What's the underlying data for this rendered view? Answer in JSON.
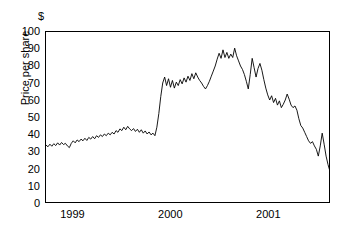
{
  "chart_data": {
    "type": "line",
    "title": "",
    "subtitle": "",
    "xlabel": "",
    "ylabel": "Price per share",
    "currency_symbol": "$",
    "grid": false,
    "legend": false,
    "legend_position": "none",
    "xlim": [
      1998.72,
      2001.63
    ],
    "ylim": [
      0,
      100
    ],
    "yticks": [
      100,
      90,
      80,
      70,
      60,
      50,
      40,
      30,
      20,
      10,
      0
    ],
    "ytick_labels": [
      "100",
      "90",
      "80",
      "70",
      "60",
      "50",
      "40",
      "30",
      "20",
      "10",
      "0"
    ],
    "xticks": [
      1999,
      2000,
      2001
    ],
    "xtick_labels": [
      "1999",
      "2000",
      "2001"
    ],
    "line_color": "#000000",
    "line_width": 1,
    "series": [
      {
        "name": "Price per share",
        "x": [
          1998.72,
          1998.75,
          1998.78,
          1998.8,
          1998.83,
          1998.86,
          1998.89,
          1998.91,
          1998.94,
          1998.97,
          1999.0,
          1999.03,
          1999.05,
          1999.08,
          1999.11,
          1999.14,
          1999.16,
          1999.19,
          1999.22,
          1999.25,
          1999.28,
          1999.3,
          1999.33,
          1999.36,
          1999.39,
          1999.41,
          1999.44,
          1999.47,
          1999.5,
          1999.53,
          1999.55,
          1999.58,
          1999.61,
          1999.64,
          1999.66,
          1999.69,
          1999.72,
          1999.75,
          1999.77,
          1999.8,
          1999.83,
          1999.86,
          1999.88,
          1999.91,
          1999.94,
          1999.97,
          2000.0,
          2000.03,
          2000.05,
          2000.08,
          2000.11,
          2000.14,
          2000.16,
          2000.19,
          2000.22,
          2000.25,
          2000.28,
          2000.3,
          2000.33,
          2000.36,
          2000.39,
          2000.41,
          2000.44,
          2000.47,
          2000.5,
          2000.53,
          2000.55,
          2000.58,
          2000.61,
          2000.64,
          2000.66,
          2000.69,
          2000.72,
          2000.75,
          2000.77,
          2000.8,
          2000.83,
          2000.86,
          2000.88,
          2000.91,
          2000.94,
          2000.97,
          2001.0,
          2001.03,
          2001.05,
          2001.08,
          2001.11,
          2001.14,
          2001.16,
          2001.19,
          2001.22,
          2001.25,
          2001.28,
          2001.3,
          2001.33,
          2001.36,
          2001.39,
          2001.41,
          2001.44,
          2001.47,
          2001.5,
          2001.53,
          2001.55,
          2001.58,
          2001.6,
          2001.63
        ],
        "y": [
          33.5,
          32.8,
          34.2,
          33.0,
          34.5,
          33.6,
          35.0,
          34.0,
          35.5,
          33.2,
          31.5,
          34.0,
          36.5,
          35.2,
          37.0,
          36.0,
          38.0,
          37.0,
          38.5,
          37.5,
          39.5,
          38.2,
          40.0,
          39.0,
          40.5,
          39.5,
          41.5,
          40.5,
          42.5,
          41.0,
          43.0,
          42.0,
          44.0,
          43.0,
          44.5,
          43.5,
          42.0,
          43.0,
          41.5,
          42.5,
          40.5,
          41.5,
          40.0,
          41.0,
          39.5,
          40.5,
          39.0,
          45.0,
          55.0,
          65.0,
          73.0,
          69.0,
          72.5,
          68.0,
          71.0,
          67.5,
          70.0,
          69.0,
          72.0,
          70.0,
          73.5,
          71.0,
          74.0,
          72.0,
          75.5,
          73.0,
          76.0,
          74.0,
          72.0,
          70.5,
          68.0,
          67.0,
          69.0,
          71.0,
          74.0,
          77.0,
          80.0,
          84.0,
          87.0,
          85.0,
          89.5,
          86.0,
          90.0,
          85.5,
          88.0,
          86.5,
          90.5,
          87.0,
          84.0,
          80.0,
          78.0,
          75.0,
          72.0,
          66.5,
          76.0,
          84.5,
          80.0,
          74.0,
          79.0,
          81.5,
          78.0,
          72.0,
          66.0,
          62.0,
          58.0,
          55.0
        ],
        "y_continued": [],
        "notes": "Stock price rises from about 33 in late 1998 to a peak near 90 in early 2000, then declines steadily through 2001 and collapses to 0."
      }
    ],
    "series_tail": {
      "x": [
        2001.63
      ],
      "y": [
        0
      ]
    },
    "full_series": {
      "name": "Price per share",
      "points": [
        [
          1998.72,
          33.5
        ],
        [
          1998.74,
          32.5
        ],
        [
          1998.76,
          34.0
        ],
        [
          1998.78,
          32.8
        ],
        [
          1998.8,
          34.3
        ],
        [
          1998.82,
          33.2
        ],
        [
          1998.84,
          34.8
        ],
        [
          1998.86,
          33.5
        ],
        [
          1998.88,
          35.0
        ],
        [
          1998.9,
          33.8
        ],
        [
          1998.92,
          34.5
        ],
        [
          1998.94,
          33.0
        ],
        [
          1998.96,
          32.0
        ],
        [
          1998.98,
          34.5
        ],
        [
          1999.0,
          36.0
        ],
        [
          1999.02,
          34.8
        ],
        [
          1999.04,
          36.5
        ],
        [
          1999.06,
          35.5
        ],
        [
          1999.08,
          37.0
        ],
        [
          1999.1,
          36.0
        ],
        [
          1999.12,
          37.5
        ],
        [
          1999.14,
          36.2
        ],
        [
          1999.16,
          38.0
        ],
        [
          1999.18,
          37.0
        ],
        [
          1999.2,
          38.5
        ],
        [
          1999.22,
          37.2
        ],
        [
          1999.24,
          39.0
        ],
        [
          1999.26,
          38.0
        ],
        [
          1999.28,
          39.5
        ],
        [
          1999.3,
          38.5
        ],
        [
          1999.32,
          40.0
        ],
        [
          1999.34,
          39.0
        ],
        [
          1999.36,
          40.5
        ],
        [
          1999.38,
          39.5
        ],
        [
          1999.4,
          41.0
        ],
        [
          1999.42,
          40.0
        ],
        [
          1999.44,
          42.0
        ],
        [
          1999.46,
          41.0
        ],
        [
          1999.48,
          43.0
        ],
        [
          1999.5,
          42.0
        ],
        [
          1999.52,
          44.0
        ],
        [
          1999.54,
          42.5
        ],
        [
          1999.56,
          44.5
        ],
        [
          1999.58,
          43.0
        ],
        [
          1999.6,
          42.0
        ],
        [
          1999.62,
          43.2
        ],
        [
          1999.64,
          41.5
        ],
        [
          1999.66,
          42.8
        ],
        [
          1999.68,
          41.0
        ],
        [
          1999.7,
          42.5
        ],
        [
          1999.72,
          40.5
        ],
        [
          1999.74,
          41.8
        ],
        [
          1999.76,
          40.0
        ],
        [
          1999.78,
          41.2
        ],
        [
          1999.8,
          39.5
        ],
        [
          1999.82,
          40.5
        ],
        [
          1999.84,
          39.0
        ],
        [
          1999.86,
          44.0
        ],
        [
          1999.88,
          52.0
        ],
        [
          1999.9,
          62.0
        ],
        [
          1999.92,
          70.0
        ],
        [
          1999.94,
          73.5
        ],
        [
          1999.96,
          68.5
        ],
        [
          1999.98,
          72.5
        ],
        [
          2000.0,
          67.5
        ],
        [
          2000.02,
          71.5
        ],
        [
          2000.04,
          67.0
        ],
        [
          2000.06,
          70.5
        ],
        [
          2000.08,
          68.5
        ],
        [
          2000.1,
          72.0
        ],
        [
          2000.12,
          69.5
        ],
        [
          2000.14,
          73.0
        ],
        [
          2000.16,
          70.5
        ],
        [
          2000.18,
          74.0
        ],
        [
          2000.2,
          71.5
        ],
        [
          2000.22,
          75.5
        ],
        [
          2000.24,
          72.5
        ],
        [
          2000.26,
          76.0
        ],
        [
          2000.28,
          73.5
        ],
        [
          2000.3,
          71.5
        ],
        [
          2000.32,
          70.0
        ],
        [
          2000.34,
          68.0
        ],
        [
          2000.36,
          66.5
        ],
        [
          2000.38,
          68.5
        ],
        [
          2000.4,
          71.0
        ],
        [
          2000.42,
          74.0
        ],
        [
          2000.44,
          77.0
        ],
        [
          2000.46,
          80.0
        ],
        [
          2000.48,
          84.0
        ],
        [
          2000.5,
          87.5
        ],
        [
          2000.52,
          84.5
        ],
        [
          2000.54,
          89.5
        ],
        [
          2000.56,
          85.0
        ],
        [
          2000.58,
          88.0
        ],
        [
          2000.6,
          84.5
        ],
        [
          2000.62,
          87.0
        ],
        [
          2000.64,
          85.0
        ],
        [
          2000.66,
          90.5
        ],
        [
          2000.68,
          86.0
        ],
        [
          2000.7,
          83.0
        ],
        [
          2000.72,
          80.0
        ],
        [
          2000.74,
          78.0
        ],
        [
          2000.76,
          75.0
        ],
        [
          2000.78,
          71.0
        ],
        [
          2000.8,
          66.5
        ],
        [
          2000.82,
          75.0
        ],
        [
          2000.84,
          84.5
        ],
        [
          2000.86,
          79.0
        ],
        [
          2000.88,
          73.5
        ],
        [
          2000.9,
          78.5
        ],
        [
          2000.92,
          81.5
        ],
        [
          2000.94,
          77.5
        ],
        [
          2000.96,
          72.0
        ],
        [
          2000.98,
          67.0
        ],
        [
          2001.0,
          63.0
        ],
        [
          2001.02,
          60.0
        ],
        [
          2001.04,
          62.5
        ],
        [
          2001.06,
          58.5
        ],
        [
          2001.08,
          61.0
        ],
        [
          2001.1,
          57.0
        ],
        [
          2001.12,
          59.5
        ],
        [
          2001.14,
          55.5
        ],
        [
          2001.16,
          57.5
        ],
        [
          2001.18,
          60.0
        ],
        [
          2001.2,
          63.5
        ],
        [
          2001.22,
          60.5
        ],
        [
          2001.24,
          57.0
        ],
        [
          2001.26,
          55.5
        ],
        [
          2001.28,
          56.5
        ],
        [
          2001.3,
          54.0
        ],
        [
          2001.32,
          49.0
        ],
        [
          2001.34,
          45.0
        ],
        [
          2001.36,
          43.5
        ],
        [
          2001.38,
          41.0
        ],
        [
          2001.4,
          38.5
        ],
        [
          2001.42,
          36.0
        ],
        [
          2001.44,
          34.5
        ],
        [
          2001.46,
          35.5
        ],
        [
          2001.48,
          33.0
        ],
        [
          2001.5,
          31.0
        ],
        [
          2001.52,
          27.0
        ],
        [
          2001.54,
          33.0
        ],
        [
          2001.56,
          40.5
        ],
        [
          2001.58,
          34.0
        ],
        [
          2001.6,
          27.0
        ],
        [
          2001.62,
          22.0
        ],
        [
          2001.64,
          18.0
        ],
        [
          2001.66,
          15.0
        ],
        [
          2001.68,
          12.5
        ],
        [
          2001.7,
          13.5
        ],
        [
          2001.72,
          11.0
        ],
        [
          2001.74,
          8.0
        ],
        [
          2001.76,
          6.0
        ],
        [
          2001.78,
          3.0
        ],
        [
          2001.8,
          0.5
        ]
      ]
    }
  },
  "axes": {
    "y_title": "Price per share",
    "currency": "$"
  }
}
